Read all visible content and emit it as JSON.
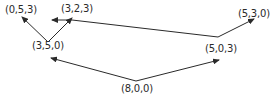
{
  "diagram": {
    "type": "state-transition-graph",
    "nodes": [
      {
        "id": "n800",
        "label": "(8,0,0)",
        "x": 121,
        "y": 83
      },
      {
        "id": "n350",
        "label": "(3,5,0)",
        "x": 32,
        "y": 40
      },
      {
        "id": "n503",
        "label": "(5,0,3)",
        "x": 205,
        "y": 43
      },
      {
        "id": "n053",
        "label": "(0,5,3)",
        "x": 5,
        "y": 4
      },
      {
        "id": "n323",
        "label": "(3,2,3)",
        "x": 61,
        "y": 3
      },
      {
        "id": "n530",
        "label": "(5,3,0)",
        "x": 238,
        "y": 8
      }
    ],
    "edges": [
      {
        "from": "(8,0,0)",
        "to": "(3,5,0)"
      },
      {
        "from": "(8,0,0)",
        "to": "(5,0,3)"
      },
      {
        "from": "(3,5,0)",
        "to": "(0,5,3)"
      },
      {
        "from": "(3,5,0)",
        "to": "(3,2,3)"
      },
      {
        "from": "(5,0,3)",
        "to": "(5,3,0)"
      },
      {
        "from": "(5,0,3)",
        "to": "(3,2,3)"
      }
    ],
    "colors": {
      "line": "#2a2a2a",
      "text": "#2a2a2a",
      "background": "#ffffff"
    }
  }
}
